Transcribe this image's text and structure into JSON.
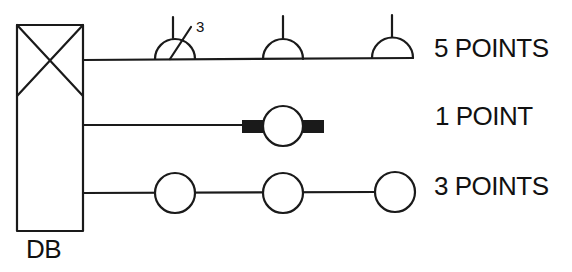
{
  "diagram": {
    "colors": {
      "stroke": "#1a1a1a",
      "background": "#ffffff"
    },
    "distribution_board": {
      "label": "DB",
      "symbol": "box-with-cross"
    },
    "circuits": [
      {
        "label": "5 POINTS",
        "symbol": "ceiling-lamp-semicircle",
        "visible_symbols": 3,
        "annotation": "3"
      },
      {
        "label": "1 POINT",
        "symbol": "lamp-circle-with-bars",
        "visible_symbols": 1
      },
      {
        "label": "3 POINTS",
        "symbol": "lamp-circle",
        "visible_symbols": 3
      }
    ]
  }
}
